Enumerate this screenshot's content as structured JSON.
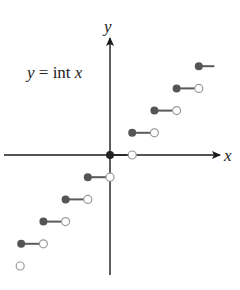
{
  "diagram": {
    "title": "y = int x",
    "title_parts": {
      "y": "y",
      "eq": " = int ",
      "x": "x"
    },
    "x_axis_label": "x",
    "y_axis_label": "y",
    "colors": {
      "axis": "#1a1a1a",
      "segment": "#5a5a5a",
      "filled_dot": "#555555",
      "open_dot_stroke": "#9a9a9a"
    },
    "origin_px": [
      110,
      155
    ],
    "unit_px": 22.2
  },
  "chart_data": {
    "type": "step",
    "title": "y = int x",
    "xlabel": "x",
    "ylabel": "y",
    "function": "greatest integer function (floor)",
    "segments": [
      {
        "y": -4,
        "x_start": -4,
        "x_end": -3,
        "start": "closed",
        "end": "open"
      },
      {
        "y": -3,
        "x_start": -3,
        "x_end": -2,
        "start": "closed",
        "end": "open"
      },
      {
        "y": -2,
        "x_start": -2,
        "x_end": -1,
        "start": "closed",
        "end": "open"
      },
      {
        "y": -1,
        "x_start": -1,
        "x_end": 0,
        "start": "closed",
        "end": "open"
      },
      {
        "y": 0,
        "x_start": 0,
        "x_end": 1,
        "start": "closed",
        "end": "open"
      },
      {
        "y": 1,
        "x_start": 1,
        "x_end": 2,
        "start": "closed",
        "end": "open"
      },
      {
        "y": 2,
        "x_start": 2,
        "x_end": 3,
        "start": "closed",
        "end": "open"
      },
      {
        "y": 3,
        "x_start": 3,
        "x_end": 4,
        "start": "closed",
        "end": "open"
      },
      {
        "y": 4,
        "x_start": 4,
        "x_end": 4.7,
        "start": "closed",
        "end": "continues"
      }
    ],
    "extra_points": [
      {
        "x": -4,
        "y": -5,
        "type": "open"
      }
    ],
    "ticks": false,
    "grid": false
  }
}
